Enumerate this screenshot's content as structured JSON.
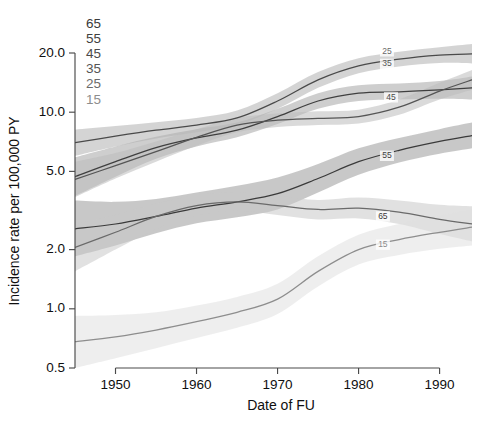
{
  "chart_data": {
    "type": "line",
    "title": "",
    "xlabel": "Date of FU",
    "ylabel": "Incidence rate per 100,000 PY",
    "yscale": "log",
    "ylim": [
      0.5,
      24.0
    ],
    "xlim": [
      1945,
      1994
    ],
    "grid": false,
    "legend_position": "top-left-inside",
    "ytick_labels": [
      "20.0",
      "10.0",
      "5.0",
      "2.0",
      "1.0",
      "0.5"
    ],
    "ytick_values": [
      20.0,
      10.0,
      5.0,
      2.0,
      1.0,
      0.5
    ],
    "xtick_labels": [
      "1950",
      "1960",
      "1970",
      "1980",
      "1990"
    ],
    "xtick_values": [
      1950,
      1960,
      1970,
      1980,
      1990
    ],
    "legend_entries": [
      "65",
      "55",
      "45",
      "35",
      "25",
      "15"
    ],
    "x": [
      1945,
      1950,
      1955,
      1960,
      1965,
      1970,
      1975,
      1980,
      1985,
      1990,
      1994
    ],
    "series": [
      {
        "name": "65",
        "label": "65",
        "color": "#3a3a3a",
        "band_color": "#9a9a9a",
        "values": [
          2.55,
          2.7,
          2.95,
          3.25,
          3.5,
          3.85,
          4.6,
          5.6,
          6.4,
          7.1,
          7.6
        ],
        "band_lower": [
          1.85,
          2.1,
          2.42,
          2.72,
          2.92,
          3.2,
          3.9,
          4.8,
          5.55,
          6.15,
          6.55
        ],
        "band_upper": [
          3.55,
          3.5,
          3.62,
          3.9,
          4.22,
          4.65,
          5.45,
          6.55,
          7.4,
          8.2,
          8.85
        ]
      },
      {
        "name": "55",
        "label": "55",
        "color": "#3f3f3f",
        "band_color": "#a6a6a6",
        "values": [
          4.7,
          5.6,
          6.6,
          7.4,
          8.1,
          9.5,
          11.4,
          12.5,
          12.7,
          13.0,
          13.3
        ],
        "band_lower": [
          3.75,
          4.7,
          5.8,
          6.7,
          7.45,
          8.7,
          10.4,
          11.4,
          11.6,
          11.7,
          11.6
        ],
        "band_upper": [
          5.9,
          6.7,
          7.5,
          8.2,
          8.85,
          10.4,
          12.5,
          13.7,
          14.0,
          14.4,
          15.2
        ]
      },
      {
        "name": "45",
        "label": "45",
        "color": "#4a4a4a",
        "band_color": "#b0b0b0",
        "values": [
          7.0,
          7.55,
          8.1,
          8.6,
          9.35,
          11.4,
          14.6,
          17.2,
          18.6,
          19.5,
          19.8
        ],
        "band_lower": [
          6.0,
          6.7,
          7.35,
          7.9,
          8.6,
          10.4,
          13.3,
          15.8,
          17.1,
          17.8,
          17.7
        ],
        "band_upper": [
          8.15,
          8.5,
          8.9,
          9.35,
          10.2,
          12.5,
          16.0,
          18.8,
          20.3,
          21.4,
          22.2
        ]
      },
      {
        "name": "35",
        "label": "35",
        "color": "#555555",
        "band_color": "#bcbcbc",
        "values": [
          4.55,
          5.35,
          6.3,
          7.45,
          8.6,
          9.1,
          9.3,
          9.5,
          10.6,
          12.8,
          14.6
        ],
        "band_lower": [
          3.7,
          4.6,
          5.6,
          6.75,
          7.9,
          8.4,
          8.6,
          8.75,
          9.7,
          11.6,
          13.0
        ],
        "band_upper": [
          5.6,
          6.2,
          7.1,
          8.2,
          9.35,
          9.85,
          10.1,
          10.3,
          11.6,
          14.1,
          16.4
        ]
      },
      {
        "name": "25",
        "label": "25",
        "color": "#6a6a6a",
        "band_color": "#c9c9c9",
        "values": [
          2.05,
          2.45,
          2.95,
          3.35,
          3.5,
          3.35,
          3.2,
          3.25,
          3.1,
          2.85,
          2.7
        ],
        "band_lower": [
          1.55,
          2.0,
          2.55,
          2.98,
          3.15,
          3.0,
          2.85,
          2.88,
          2.7,
          2.4,
          2.2
        ],
        "band_upper": [
          2.7,
          3.0,
          3.42,
          3.78,
          3.9,
          3.75,
          3.58,
          3.68,
          3.56,
          3.38,
          3.32
        ]
      },
      {
        "name": "15",
        "label": "15",
        "color": "#8d8d8d",
        "band_color": "#e0e0e0",
        "values": [
          0.68,
          0.72,
          0.78,
          0.86,
          0.96,
          1.12,
          1.55,
          2.0,
          2.25,
          2.45,
          2.6
        ],
        "band_lower": [
          0.5,
          0.56,
          0.63,
          0.71,
          0.8,
          0.94,
          1.3,
          1.68,
          1.88,
          2.02,
          2.1
        ],
        "band_upper": [
          0.92,
          0.93,
          0.96,
          1.04,
          1.15,
          1.34,
          1.85,
          2.38,
          2.7,
          2.98,
          3.22
        ]
      }
    ],
    "inline_annotations": [
      {
        "text": "25",
        "x": 1983.5,
        "y": 20.4
      },
      {
        "text": "35",
        "x": 1983.5,
        "y": 17.6
      },
      {
        "text": "45",
        "x": 1984.0,
        "y": 11.9
      },
      {
        "text": "55",
        "x": 1983.5,
        "y": 6.0
      },
      {
        "text": "65",
        "x": 1983.0,
        "y": 2.95
      },
      {
        "text": "15",
        "x": 1983.0,
        "y": 2.12
      }
    ]
  }
}
